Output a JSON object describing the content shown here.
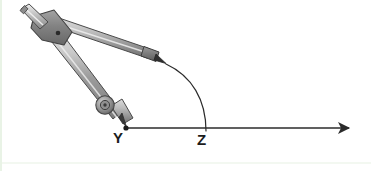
{
  "figure": {
    "kind": "geometry-construction-diagram",
    "background_color": "#ffffff",
    "stroke_color": "#2b2b2b",
    "edge_tint_color": "#e9f3e6",
    "metal": {
      "light": "#d2d2d2",
      "mid": "#a8a8a8",
      "dark": "#7d7d7d",
      "darkest": "#595959",
      "outline": "#4a4a4a"
    },
    "labels": {
      "vertex": "Y",
      "arc_intersection": "Z"
    },
    "points": {
      "Y": {
        "x": 125,
        "y": 128
      },
      "Z": {
        "x": 205,
        "y": 128
      },
      "hinge": {
        "x": 48,
        "y": 31
      },
      "handle_top": {
        "x": 22,
        "y": 11
      },
      "pencil_tip": {
        "x": 165,
        "y": 63
      },
      "ray_arrow_end": {
        "x": 352,
        "y": 128
      },
      "adjust_wheel": {
        "x": 105,
        "y": 105
      }
    },
    "elements": {
      "ray_label": "ray YZ",
      "arc_label": "compass arc",
      "compass_label": "drawing compass",
      "arrow_label": "ray arrowhead",
      "needle_label": "compass needle point",
      "pencil_label": "compass pencil lead",
      "wheel_label": "compass adjustment wheel",
      "hinge_label": "compass hinge",
      "handle_label": "compass handle"
    }
  }
}
